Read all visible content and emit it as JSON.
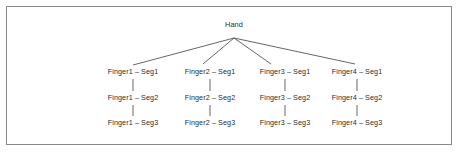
{
  "figure": {
    "type": "tree-diagram",
    "border_color": "#8a8a8a",
    "background_color": "#ffffff",
    "line_color": "#555555",
    "text_color": "#2b2b2b"
  },
  "tree": {
    "root": {
      "label": "Hand",
      "x": 234,
      "y": 25,
      "apex_x": 234,
      "apex_y": 38
    },
    "branches": [
      {
        "label": "Finger1",
        "column_x": 133,
        "edge_end_x": 133,
        "edge_end_y": 65,
        "segments": [
          {
            "label": "Finger1 – Seg1",
            "y": 72
          },
          {
            "label": "Finger1 – Seg2",
            "y": 98
          },
          {
            "label": "Finger1 – Seg3",
            "y": 123
          }
        ]
      },
      {
        "label": "Finger2",
        "column_x": 210,
        "edge_end_x": 203,
        "edge_end_y": 64,
        "segments": [
          {
            "label": "Finger2 – Seg1",
            "y": 72
          },
          {
            "label": "Finger2 – Seg2",
            "y": 98
          },
          {
            "label": "Finger2 – Seg3",
            "y": 123
          }
        ]
      },
      {
        "label": "Finger3",
        "column_x": 285,
        "edge_end_x": 271,
        "edge_end_y": 64,
        "segments": [
          {
            "label": "Finger3 – Seg1",
            "y": 72
          },
          {
            "label": "Finger3 – Seg2",
            "y": 98
          },
          {
            "label": "Finger3 – Seg3",
            "y": 123
          }
        ]
      },
      {
        "label": "Finger4",
        "column_x": 357,
        "edge_end_x": 355,
        "edge_end_y": 64,
        "segments": [
          {
            "label": "Finger4 – Seg1",
            "y": 72
          },
          {
            "label": "Finger4 – Seg2",
            "y": 98
          },
          {
            "label": "Finger4 – Seg3",
            "y": 123
          }
        ]
      }
    ],
    "connector": {
      "style": "vertical-tick",
      "gaps": [
        {
          "y_top": 79,
          "y_bottom": 91
        },
        {
          "y_top": 105,
          "y_bottom": 116
        }
      ]
    }
  }
}
